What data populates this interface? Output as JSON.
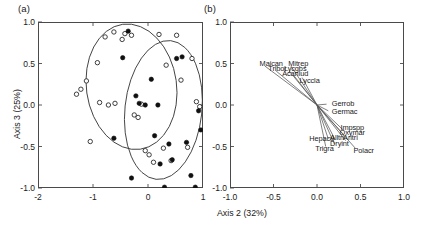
{
  "figure": {
    "panel_a_tag": "(a)",
    "panel_b_tag": "(b)",
    "xlabel": "Axis 2 (32%)",
    "ylabel": "Axis 3 (25%)"
  },
  "chart_data": [
    {
      "type": "scatter",
      "panel": "(a)",
      "title": "",
      "xlabel": "Axis 2 (32%)",
      "ylabel": "Axis 3 (25%)",
      "xlim": [
        -2,
        1
      ],
      "ylim": [
        -1.0,
        1.0
      ],
      "xticks": [
        -2,
        -1,
        0,
        1
      ],
      "xticklabels": [
        "-2",
        "-1",
        "0",
        "1"
      ],
      "yticks": [
        -1.0,
        -0.5,
        0.0,
        0.5,
        1.0
      ],
      "yticklabels": [
        "-1.0",
        "-0.5",
        "0.0",
        "0.5",
        "1.0"
      ],
      "grid": false,
      "legend": "none",
      "series": [
        {
          "name": "open-circles",
          "marker": "open circle",
          "color": "#1a1a1a",
          "points": [
            [
              -1.3,
              0.13
            ],
            [
              -1.22,
              0.19
            ],
            [
              -1.12,
              0.29
            ],
            [
              -1.05,
              -0.44
            ],
            [
              -0.92,
              0.51
            ],
            [
              -0.88,
              0.03
            ],
            [
              -0.78,
              0.82
            ],
            [
              -0.72,
              0.0
            ],
            [
              -0.62,
              0.88
            ],
            [
              -0.6,
              0.02
            ],
            [
              -0.47,
              0.79
            ],
            [
              -0.42,
              0.86
            ],
            [
              -0.3,
              0.84
            ],
            [
              -0.25,
              -0.12
            ],
            [
              -0.18,
              -0.15
            ],
            [
              -0.12,
              0.01
            ],
            [
              -0.05,
              -0.55
            ],
            [
              0.02,
              -0.6
            ],
            [
              0.1,
              -0.69
            ],
            [
              0.2,
              0.85
            ],
            [
              0.28,
              -0.52
            ],
            [
              0.33,
              0.48
            ],
            [
              0.42,
              -0.67
            ],
            [
              0.52,
              0.84
            ],
            [
              0.6,
              0.3
            ],
            [
              0.72,
              -0.51
            ],
            [
              0.8,
              0.56
            ],
            [
              0.88,
              0.04
            ],
            [
              0.94,
              -0.02
            ]
          ]
        },
        {
          "name": "filled-circles",
          "marker": "filled circle",
          "color": "#101010",
          "points": [
            [
              -0.62,
              -0.4
            ],
            [
              -0.46,
              0.57
            ],
            [
              -0.36,
              0.89
            ],
            [
              -0.3,
              -0.88
            ],
            [
              -0.22,
              0.11
            ],
            [
              -0.16,
              0.02
            ],
            [
              -0.05,
              0.0
            ],
            [
              0.06,
              0.31
            ],
            [
              0.12,
              -0.37
            ],
            [
              0.18,
              0.0
            ],
            [
              0.22,
              -0.71
            ],
            [
              0.3,
              -0.99
            ],
            [
              0.38,
              -0.47
            ],
            [
              0.44,
              -0.66
            ],
            [
              0.52,
              0.56
            ],
            [
              0.62,
              0.58
            ],
            [
              0.7,
              -0.45
            ],
            [
              0.78,
              -0.85
            ],
            [
              0.86,
              -0.99
            ],
            [
              0.92,
              -0.07
            ],
            [
              0.96,
              -0.3
            ]
          ]
        }
      ],
      "ellipses": [
        {
          "name": "ellipse-open-group",
          "cx": -0.3,
          "cy": 0.22,
          "rx": 0.82,
          "ry": 0.76,
          "rotation": -8
        },
        {
          "name": "ellipse-filled-group",
          "cx": 0.28,
          "cy": -0.06,
          "rx": 0.7,
          "ry": 0.84,
          "rotation": 6
        }
      ]
    },
    {
      "type": "scatter",
      "panel": "(b)",
      "subtype": "biplot-vectors",
      "title": "",
      "xlabel": "Axis 2 (32%)",
      "ylabel": "",
      "xlim": [
        -1.0,
        1.0
      ],
      "ylim": [
        -1.0,
        1.0
      ],
      "xticks": [
        -1.0,
        -0.5,
        0.0,
        0.5,
        1.0
      ],
      "xticklabels": [
        "-1.0",
        "-0.5",
        "0.0",
        "0.5",
        "1.0"
      ],
      "yticks": [
        -1.0,
        -0.5,
        0.0,
        0.5,
        1.0
      ],
      "yticklabels": [
        "-1.0",
        "-0.5",
        "0.0",
        "0.5",
        "1.0"
      ],
      "grid": false,
      "legend": "none",
      "origin": [
        0.0,
        0.0
      ],
      "vectors": [
        {
          "label": "Maican",
          "x": -0.6,
          "y": 0.47,
          "label_x": -0.66,
          "label_y": 0.5,
          "anchor": "start"
        },
        {
          "label": "Mitrep",
          "x": -0.3,
          "y": 0.47,
          "label_x": -0.33,
          "label_y": 0.5,
          "anchor": "start"
        },
        {
          "label": "Tribor",
          "x": -0.47,
          "y": 0.41,
          "label_x": -0.56,
          "label_y": 0.435,
          "anchor": "start"
        },
        {
          "label": "Lycgbs",
          "x": -0.32,
          "y": 0.41,
          "label_x": -0.38,
          "label_y": 0.435,
          "anchor": "start"
        },
        {
          "label": "Acanlud",
          "x": -0.27,
          "y": 0.36,
          "label_x": -0.4,
          "label_y": 0.375,
          "anchor": "start"
        },
        {
          "label": "Lyccla",
          "x": -0.17,
          "y": 0.33,
          "label_x": -0.2,
          "label_y": 0.285,
          "anchor": "start"
        },
        {
          "label": "Gerrob",
          "x": 0.11,
          "y": 0.01,
          "label_x": 0.17,
          "label_y": 0.015,
          "anchor": "start"
        },
        {
          "label": "Germac",
          "x": 0.13,
          "y": -0.07,
          "label_x": 0.17,
          "label_y": -0.085,
          "anchor": "start"
        },
        {
          "label": "Impspp",
          "x": 0.3,
          "y": -0.3,
          "label_x": 0.27,
          "label_y": -0.275,
          "anchor": "start"
        },
        {
          "label": "Oxymar",
          "x": 0.3,
          "y": -0.35,
          "label_x": 0.26,
          "label_y": -0.335,
          "anchor": "start"
        },
        {
          "label": "Alltri",
          "x": 0.21,
          "y": -0.42,
          "label_x": 0.15,
          "label_y": -0.395,
          "anchor": "start"
        },
        {
          "label": "Aritri",
          "x": 0.33,
          "y": -0.43,
          "label_x": 0.3,
          "label_y": -0.395,
          "anchor": "start"
        },
        {
          "label": "Hepacu",
          "x": 0.13,
          "y": -0.41,
          "label_x": -0.09,
          "label_y": -0.415,
          "anchor": "start"
        },
        {
          "label": "Dryint",
          "x": 0.2,
          "y": -0.47,
          "label_x": 0.15,
          "label_y": -0.465,
          "anchor": "start"
        },
        {
          "label": "Trigra",
          "x": 0.1,
          "y": -0.5,
          "label_x": -0.02,
          "label_y": -0.535,
          "anchor": "start"
        },
        {
          "label": "Polacr",
          "x": 0.44,
          "y": -0.52,
          "label_x": 0.42,
          "label_y": -0.555,
          "anchor": "start"
        }
      ]
    }
  ]
}
